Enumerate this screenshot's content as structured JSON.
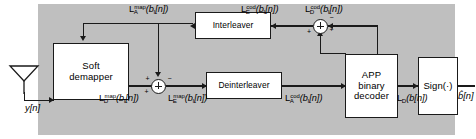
{
  "diagram": {
    "background_color": "#ffffff",
    "panel_color": "#bfbfbf",
    "line_color": "#1a1a1a"
  },
  "blocks": {
    "demapper": {
      "line1": "Soft",
      "line2": "demapper"
    },
    "interleaver": {
      "line1": "Interleaver"
    },
    "deinterleaver": {
      "line1": "Deinterleaver"
    },
    "decoder": {
      "line1": "APP",
      "line2": "binary",
      "line3": "decoder"
    },
    "sign": {
      "line1": "Sign(·)"
    }
  },
  "signals": {
    "input": {
      "name": "y[n]",
      "base": "y",
      "sub": "",
      "arg": "[n]"
    },
    "output": {
      "name": "b̂[n]",
      "base": "b",
      "arg": "[n]"
    },
    "la_map": {
      "base": "L",
      "sub": "A",
      "sup": "map",
      "arg": "(b",
      "argsub": "I",
      "argtail": "[n])"
    },
    "ld_map": {
      "base": "L",
      "sub": "D",
      "sup": "map",
      "arg": "(b",
      "argsub": "I",
      "argtail": "[n])"
    },
    "le_map": {
      "base": "L",
      "sub": "E",
      "sup": "map",
      "arg": "(b",
      "argsub": "I",
      "argtail": "[n])"
    },
    "la_cod": {
      "base": "L",
      "sub": "A",
      "sup": "cod",
      "arg": "(b",
      "argsub": "I",
      "argtail": "[n])"
    },
    "ld_cod": {
      "base": "L",
      "sub": "D",
      "sup": "cod",
      "arg": "(b",
      "argsub": "I",
      "argtail": "[n])"
    },
    "le_cod": {
      "base": "L",
      "sub": "E",
      "sup": "cod",
      "arg": "(b",
      "argsub": "I",
      "argtail": "[n])"
    },
    "ld_b": {
      "base": "L",
      "sub": "D",
      "sup": "",
      "arg": "(b",
      "argsub": "",
      "argtail": "[n])"
    }
  },
  "adders": {
    "bottom": {
      "plus_left": "+",
      "minus_right": "−",
      "plus_bottom": "+"
    },
    "top": {
      "plus_right": "+",
      "minus_top": "−",
      "plus_bottom": "+"
    }
  },
  "icons": {
    "antenna": "antenna-icon",
    "adder_glyph": "⊕"
  }
}
